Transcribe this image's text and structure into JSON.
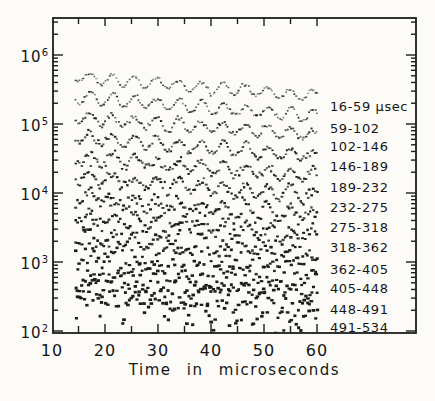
{
  "figure": {
    "background": "#fcfbf8",
    "ink": "#1d1d1d",
    "dot_color": "#1d1d1d"
  },
  "chart_data": {
    "type": "scatter",
    "title": "",
    "xlabel": "Time in microseconds",
    "ylabel": "",
    "grid": "off",
    "legend_position": "right-inside",
    "x_axis": {
      "tick_labels": [
        "10",
        "20",
        "30",
        "40",
        "50",
        "60"
      ],
      "tick_values": [
        10,
        20,
        30,
        40,
        50,
        60
      ],
      "minor_tick_step": 5,
      "minor_tick_range": [
        15,
        60
      ],
      "xlim": [
        10,
        78
      ]
    },
    "y_axis": {
      "scale": "log",
      "tick_labels": [
        {
          "base": "10",
          "exp": "2"
        },
        {
          "base": "10",
          "exp": "3"
        },
        {
          "base": "10",
          "exp": "4"
        },
        {
          "base": "10",
          "exp": "5"
        },
        {
          "base": "10",
          "exp": "6"
        }
      ],
      "tick_values": [
        100,
        1000,
        10000,
        100000,
        1000000
      ],
      "ylim": [
        93,
        3500000
      ]
    },
    "series": [
      {
        "label": "16-59 μsec",
        "range_usec": [
          16,
          59
        ],
        "counts_start": 468000,
        "counts_end": 258000,
        "period_usec": 4.2,
        "osc_amplitude_log10": 0.08,
        "noise_log10": 0.012
      },
      {
        "label": "59-102",
        "range_usec": [
          59,
          102
        ],
        "counts_start": 240000,
        "counts_end": 132000,
        "period_usec": 4.2,
        "osc_amplitude_log10": 0.082,
        "noise_log10": 0.015
      },
      {
        "label": "102-146",
        "range_usec": [
          102,
          146
        ],
        "counts_start": 123000,
        "counts_end": 68000,
        "period_usec": 4.2,
        "osc_amplitude_log10": 0.084,
        "noise_log10": 0.019
      },
      {
        "label": "146-189",
        "range_usec": [
          146,
          189
        ],
        "counts_start": 63000,
        "counts_end": 35000,
        "period_usec": 4.2,
        "osc_amplitude_log10": 0.086,
        "noise_log10": 0.024
      },
      {
        "label": "189-232",
        "range_usec": [
          189,
          232
        ],
        "counts_start": 32400,
        "counts_end": 17900,
        "period_usec": 4.2,
        "osc_amplitude_log10": 0.089,
        "noise_log10": 0.03
      },
      {
        "label": "232-275",
        "range_usec": [
          232,
          275
        ],
        "counts_start": 16600,
        "counts_end": 9200,
        "period_usec": 4.2,
        "osc_amplitude_log10": 0.092,
        "noise_log10": 0.037
      },
      {
        "label": "275-318",
        "range_usec": [
          275,
          318
        ],
        "counts_start": 8500,
        "counts_end": 4700,
        "period_usec": 4.2,
        "osc_amplitude_log10": 0.095,
        "noise_log10": 0.046
      },
      {
        "label": "318-362",
        "range_usec": [
          318,
          362
        ],
        "counts_start": 4400,
        "counts_end": 2400,
        "period_usec": 4.2,
        "osc_amplitude_log10": 0.099,
        "noise_log10": 0.057
      },
      {
        "label": "362-405",
        "range_usec": [
          362,
          405
        ],
        "counts_start": 2240,
        "counts_end": 1240,
        "period_usec": 4.2,
        "osc_amplitude_log10": 0.103,
        "noise_log10": 0.071
      },
      {
        "label": "405-448",
        "range_usec": [
          405,
          448
        ],
        "counts_start": 1150,
        "counts_end": 630,
        "period_usec": 4.2,
        "osc_amplitude_log10": 0.108,
        "noise_log10": 0.088
      },
      {
        "label": "448-491",
        "range_usec": [
          448,
          491
        ],
        "counts_start": 590,
        "counts_end": 325,
        "period_usec": 4.2,
        "osc_amplitude_log10": 0.113,
        "noise_log10": 0.11
      },
      {
        "label": "491-534",
        "range_usec": [
          491,
          534
        ],
        "counts_start": 300,
        "counts_end": 165,
        "period_usec": 4.2,
        "osc_amplitude_log10": 0.119,
        "noise_log10": 0.138
      }
    ]
  }
}
